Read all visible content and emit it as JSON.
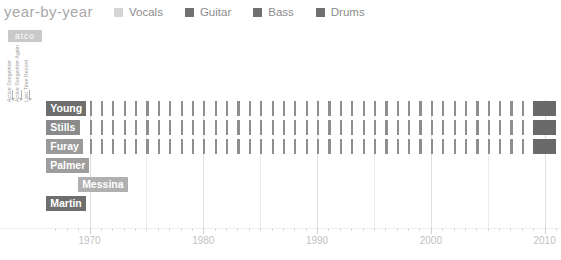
{
  "header": {
    "title": "year-by-year",
    "badge": "atco"
  },
  "legend": {
    "items": [
      {
        "label": "Vocals",
        "color": "#d5d5d5",
        "icon": "legend-swatch"
      },
      {
        "label": "Guitar",
        "color": "#707070",
        "icon": "legend-swatch"
      },
      {
        "label": "Bass",
        "color": "#707070",
        "icon": "legend-swatch"
      },
      {
        "label": "Drums",
        "color": "#707070",
        "icon": "legend-swatch"
      }
    ]
  },
  "annotations": [
    {
      "text": "Active Songwriter"
    },
    {
      "text": "Active Songwriter Again"
    },
    {
      "text": "Last Time Record"
    }
  ],
  "chart_data": {
    "type": "bar",
    "title": "year-by-year",
    "xlabel": "",
    "ylabel": "",
    "xlim": [
      1966,
      2011
    ],
    "grid": true,
    "legend_position": "top",
    "tick_labels": [
      "1970",
      "1980",
      "1990",
      "2000",
      "2010"
    ],
    "tick_values": [
      1970,
      1980,
      1990,
      2000,
      2010
    ],
    "minor_tick_step": 1,
    "categories": [
      "Young",
      "Stills",
      "Furay",
      "Palmer",
      "Messina",
      "Martin"
    ],
    "series": [
      {
        "name": "Young",
        "label_color": "#6e6e6e",
        "label_x": 1966.2,
        "years": [
          1967,
          1968,
          1969,
          1970,
          1971,
          1972,
          1973,
          1974,
          1975,
          1976,
          1977,
          1978,
          1979,
          1980,
          1981,
          1982,
          1983,
          1984,
          1985,
          1986,
          1987,
          1988,
          1989,
          1990,
          1991,
          1992,
          1993,
          1994,
          1995,
          1996,
          1997,
          1998,
          1999,
          2000,
          2001,
          2002,
          2003,
          2004,
          2005,
          2006,
          2007,
          2008
        ],
        "spans": [
          {
            "start": 2009,
            "end": 2011,
            "kind": "wide"
          }
        ]
      },
      {
        "name": "Stills",
        "label_color": "#8a8a8a",
        "label_x": 1966.2,
        "years": [
          1967,
          1968,
          1969,
          1970,
          1971,
          1972,
          1973,
          1974,
          1975,
          1976,
          1977,
          1978,
          1979,
          1980,
          1981,
          1982,
          1983,
          1984,
          1985,
          1986,
          1987,
          1988,
          1989,
          1990,
          1991,
          1992,
          1993,
          1994,
          1995,
          1996,
          1997,
          1998,
          1999,
          2000,
          2001,
          2002,
          2003,
          2004,
          2005,
          2006,
          2007,
          2008
        ],
        "spans": [
          {
            "start": 2009,
            "end": 2011,
            "kind": "wide"
          }
        ]
      },
      {
        "name": "Furay",
        "label_color": "#9a9a9a",
        "label_x": 1966.2,
        "years": [
          1967,
          1968,
          1969,
          1970,
          1971,
          1972,
          1973,
          1974,
          1975,
          1976,
          1977,
          1978,
          1979,
          1980,
          1981,
          1982,
          1983,
          1984,
          1985,
          1986,
          1987,
          1988,
          1989,
          1990,
          1991,
          1992,
          1993,
          1994,
          1995,
          1996,
          1997,
          1998,
          1999,
          2000,
          2001,
          2002,
          2003,
          2004,
          2005,
          2006,
          2007,
          2008
        ],
        "spans": [
          {
            "start": 2009,
            "end": 2011,
            "kind": "wide"
          }
        ]
      },
      {
        "name": "Palmer",
        "label_color": "#9e9e9e",
        "label_x": 1966.2,
        "years": [],
        "spans": []
      },
      {
        "name": "Messina",
        "label_color": "#b0b0b0",
        "label_x": 1969.0,
        "years": [],
        "spans": []
      },
      {
        "name": "Martin",
        "label_color": "#6e6e6e",
        "label_x": 1966.2,
        "years": [],
        "spans": []
      }
    ]
  }
}
